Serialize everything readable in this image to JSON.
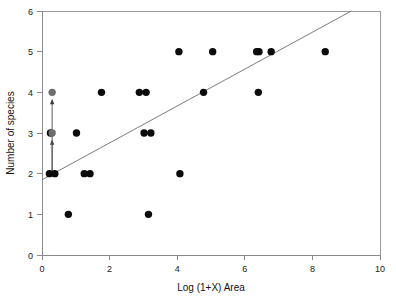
{
  "chart_data": {
    "type": "scatter",
    "title": "",
    "xlabel": "Log (1+X) Area",
    "ylabel": "Number of species",
    "xlim": [
      0,
      10
    ],
    "ylim": [
      0,
      6
    ],
    "xticks": [
      0,
      2,
      4,
      6,
      8,
      10
    ],
    "yticks": [
      0,
      1,
      2,
      3,
      4,
      5,
      6
    ],
    "xtick_labels": [
      "0",
      "2",
      "4",
      "6",
      "8",
      "10"
    ],
    "ytick_labels": [
      "0",
      "1",
      "2",
      "3",
      "4",
      "5",
      "6"
    ],
    "grid": false,
    "legend": false,
    "series": [
      {
        "name": "observations",
        "color": "#0b0b0b",
        "marker": "filled-circle",
        "points": [
          {
            "x": 0.22,
            "y": 2.0
          },
          {
            "x": 0.38,
            "y": 2.0
          },
          {
            "x": 0.25,
            "y": 3.0
          },
          {
            "x": 0.78,
            "y": 1.0
          },
          {
            "x": 1.02,
            "y": 3.0
          },
          {
            "x": 1.25,
            "y": 2.0
          },
          {
            "x": 1.42,
            "y": 2.0
          },
          {
            "x": 1.76,
            "y": 4.0
          },
          {
            "x": 2.88,
            "y": 4.0
          },
          {
            "x": 3.02,
            "y": 3.0
          },
          {
            "x": 3.08,
            "y": 4.0
          },
          {
            "x": 3.15,
            "y": 1.0
          },
          {
            "x": 3.22,
            "y": 3.0
          },
          {
            "x": 4.05,
            "y": 5.0
          },
          {
            "x": 4.08,
            "y": 2.0
          },
          {
            "x": 4.78,
            "y": 4.0
          },
          {
            "x": 5.05,
            "y": 5.0
          },
          {
            "x": 6.35,
            "y": 5.0
          },
          {
            "x": 6.42,
            "y": 5.0
          },
          {
            "x": 6.4,
            "y": 4.0
          },
          {
            "x": 6.78,
            "y": 5.0
          },
          {
            "x": 8.38,
            "y": 5.0
          }
        ]
      },
      {
        "name": "highlighted",
        "color": "#6e6e6e",
        "marker": "filled-circle",
        "points": [
          {
            "x": 0.3,
            "y": 3.0
          },
          {
            "x": 0.3,
            "y": 4.0
          }
        ]
      }
    ],
    "fit_line": {
      "name": "regression-line",
      "color": "#7d7d7d",
      "x_start": 0.0,
      "y_start": 1.85,
      "x_end": 9.15,
      "y_end": 6.0,
      "slope": 0.4536,
      "intercept": 1.85
    },
    "annotations": [
      {
        "type": "arrow",
        "x": 0.3,
        "y_start": 2.0,
        "y_end": 2.82,
        "direction": "up"
      },
      {
        "type": "arrow",
        "x": 0.3,
        "y_start": 2.0,
        "y_end": 3.82,
        "direction": "up"
      }
    ]
  },
  "axes": {
    "x_title": "Log (1+X) Area",
    "y_title": "Number of species"
  }
}
